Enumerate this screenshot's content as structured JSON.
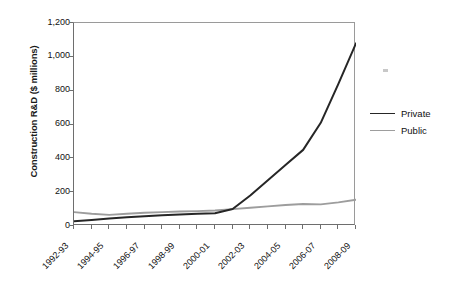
{
  "chart_data": {
    "type": "line",
    "title": "",
    "xlabel": "",
    "ylabel": "Construction R&D ($ millions)",
    "ylim": [
      0,
      1200
    ],
    "yticks": [
      0,
      200,
      400,
      600,
      800,
      1000,
      1200
    ],
    "ytick_labels": [
      "0",
      "200",
      "400",
      "600",
      "800",
      "1,000",
      "1,200"
    ],
    "grid": false,
    "legend_position": "right",
    "x": [
      "1992-93",
      "1993-94",
      "1994-95",
      "1995-96",
      "1996-97",
      "1997-98",
      "1998-99",
      "1999-00",
      "2000-01",
      "2001-02",
      "2002-03",
      "2003-04",
      "2004-05",
      "2005-06",
      "2006-07",
      "2007-08",
      "2008-09"
    ],
    "xtick_labels": [
      "1992-93",
      "1994-95",
      "1996-97",
      "1998-99",
      "2000-01",
      "2002-03",
      "2004-05",
      "2006-07",
      "2008-09"
    ],
    "series": [
      {
        "name": "Private",
        "color": "#262626",
        "values": [
          28,
          36,
          44,
          52,
          58,
          63,
          68,
          72,
          75,
          100,
          180,
          270,
          360,
          450,
          610,
          840,
          1080
        ]
      },
      {
        "name": "Public",
        "color": "#9d9d9d",
        "values": [
          82,
          72,
          66,
          72,
          78,
          82,
          86,
          88,
          92,
          100,
          108,
          116,
          124,
          130,
          128,
          140,
          155
        ]
      }
    ]
  },
  "legend": {
    "items": [
      {
        "label": "Private",
        "color": "#262626"
      },
      {
        "label": "Public",
        "color": "#9d9d9d"
      }
    ]
  }
}
